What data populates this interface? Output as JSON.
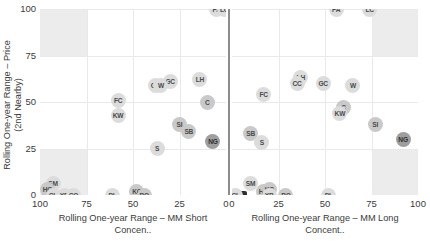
{
  "axes": {
    "y_title": "Rolling One-year Range – Price\n(2nd Nearby)",
    "y_ticks": [
      "100",
      "75",
      "50",
      "25",
      "0"
    ],
    "left": {
      "x_title": "Rolling One-year Range – MM Short\nConcen..",
      "x_ticks": [
        "100",
        "75",
        "50",
        "25",
        "0"
      ]
    },
    "right": {
      "x_title": "Rolling One-year Range – MM Long\nConcent..",
      "x_ticks": [
        "0",
        "25",
        "50",
        "75",
        "100"
      ]
    }
  },
  "colors": {
    "grid": "#e9e9e9",
    "shade": "#e6e6e6",
    "marker": "#dcdcdc",
    "marker_dark": "#9e9e9e",
    "divider": "#8c8c8c",
    "text": "#3b3b3b"
  },
  "chart_data": {
    "type": "scatter",
    "title": "",
    "panels": [
      {
        "name": "MM Short Concentration",
        "xlabel": "Rolling One-year Range – MM Short Concen..",
        "ylabel": "Rolling One-year Range – Price (2nd Nearby)",
        "xlim": [
          100,
          0
        ],
        "ylim": [
          0,
          100
        ],
        "x_reversed": true,
        "grid": true,
        "shaded_regions": [
          {
            "x": [
              100,
              75
            ],
            "y": [
              75,
              100
            ]
          },
          {
            "x": [
              100,
              75
            ],
            "y": [
              0,
              25
            ]
          }
        ],
        "points": [
          {
            "label": "PA",
            "x": 5,
            "y": 100
          },
          {
            "label": "LC",
            "x": 1,
            "y": 100
          },
          {
            "label": "LH",
            "x": 14,
            "y": 62
          },
          {
            "label": "GC",
            "x": 30,
            "y": 61
          },
          {
            "label": "CC",
            "x": 38,
            "y": 59
          },
          {
            "label": "W",
            "x": 35,
            "y": 59
          },
          {
            "label": "C",
            "x": 10,
            "y": 50
          },
          {
            "label": "FC",
            "x": 58,
            "y": 51
          },
          {
            "label": "KW",
            "x": 58,
            "y": 43
          },
          {
            "label": "SI",
            "x": 25,
            "y": 38
          },
          {
            "label": "SB",
            "x": 20,
            "y": 34
          },
          {
            "label": "NG",
            "x": 7,
            "y": 29
          },
          {
            "label": "S",
            "x": 37,
            "y": 25
          },
          {
            "label": "SM",
            "x": 93,
            "y": 6
          },
          {
            "label": "HG",
            "x": 96,
            "y": 3
          },
          {
            "label": "CL",
            "x": 93,
            "y": 0
          },
          {
            "label": "XB",
            "x": 87,
            "y": 0
          },
          {
            "label": "CO",
            "x": 82,
            "y": 0
          },
          {
            "label": "PL",
            "x": 61,
            "y": 0
          },
          {
            "label": "KC",
            "x": 48,
            "y": 2
          },
          {
            "label": "BO",
            "x": 44,
            "y": 0
          }
        ]
      },
      {
        "name": "MM Long Concentration",
        "xlabel": "Rolling One-year Range – MM Long Concent..",
        "ylabel": "Rolling One-year Range – Price (2nd Nearby)",
        "xlim": [
          0,
          100
        ],
        "ylim": [
          0,
          100
        ],
        "x_reversed": false,
        "grid": true,
        "shaded_regions": [
          {
            "x": [
              75,
              100
            ],
            "y": [
              75,
              100
            ]
          },
          {
            "x": [
              75,
              100
            ],
            "y": [
              0,
              25
            ]
          }
        ],
        "points": [
          {
            "label": "PA",
            "x": 56,
            "y": 100
          },
          {
            "label": "LC",
            "x": 74,
            "y": 100
          },
          {
            "label": "LH",
            "x": 37,
            "y": 63
          },
          {
            "label": "CC",
            "x": 35,
            "y": 60
          },
          {
            "label": "GC",
            "x": 49,
            "y": 60
          },
          {
            "label": "W",
            "x": 65,
            "y": 59
          },
          {
            "label": "FC",
            "x": 17,
            "y": 54
          },
          {
            "label": "C",
            "x": 60,
            "y": 47
          },
          {
            "label": "KW",
            "x": 58,
            "y": 44
          },
          {
            "label": "SI",
            "x": 77,
            "y": 38
          },
          {
            "label": "SB",
            "x": 10,
            "y": 33
          },
          {
            "label": "NG",
            "x": 92,
            "y": 30
          },
          {
            "label": "S",
            "x": 16,
            "y": 28
          },
          {
            "label": "SM",
            "x": 10,
            "y": 6
          },
          {
            "label": "CL",
            "x": 2,
            "y": 0
          },
          {
            "label": "HG",
            "x": 17,
            "y": 2
          },
          {
            "label": "KC",
            "x": 20,
            "y": 3
          },
          {
            "label": "XB",
            "x": 20,
            "y": 0
          },
          {
            "label": "BO",
            "x": 29,
            "y": 0
          },
          {
            "label": "PL",
            "x": 52,
            "y": 0
          }
        ]
      }
    ]
  }
}
